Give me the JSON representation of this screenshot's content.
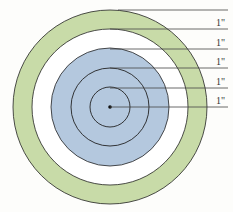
{
  "diagram": {
    "type": "concentric-circles",
    "center": [
      110,
      107
    ],
    "colors": {
      "outer_ring": "#c8dba8",
      "gap_ring": "#ffffff",
      "inner_disc": "#b4c8de",
      "stroke": "#222222",
      "background": "#fdfdfb"
    },
    "radii": [
      97,
      78,
      59,
      39,
      20
    ],
    "labels": [
      "1\"",
      "1\"",
      "1\"",
      "1\"",
      "1\""
    ]
  }
}
